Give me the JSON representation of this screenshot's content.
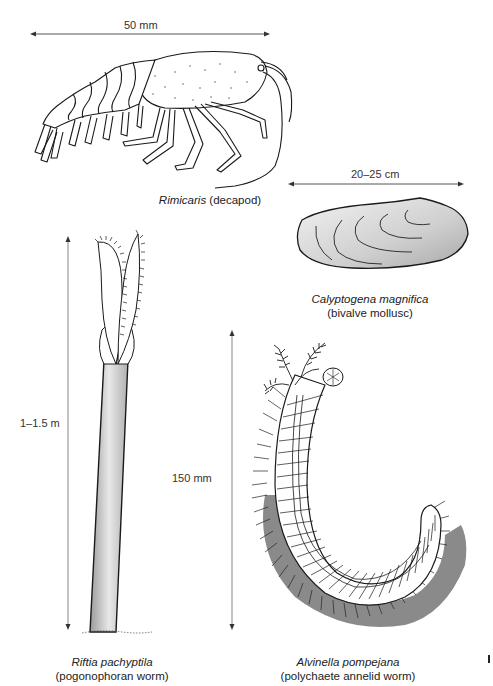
{
  "figure": {
    "specimens": [
      {
        "id": "rimicaris",
        "scientific_name": "Rimicaris",
        "common_name": "(decapod)",
        "scale_label": "50 mm",
        "scale_orientation": "horizontal"
      },
      {
        "id": "calyptogena",
        "scientific_name": "Calyptogena magnifica",
        "common_name": "(bivalve mollusc)",
        "scale_label": "20–25 cm",
        "scale_orientation": "horizontal"
      },
      {
        "id": "riftia",
        "scientific_name": "Riftia pachyptila",
        "common_name": "(pogonophoran worm)",
        "scale_label": "1–1.5 m",
        "scale_orientation": "vertical"
      },
      {
        "id": "alvinella",
        "scientific_name": "Alvinella pompejana",
        "common_name": "(polychaete annelid worm)",
        "scale_label": "150 mm",
        "scale_orientation": "vertical"
      }
    ],
    "colors": {
      "line": "#1a1a1a",
      "scale_line": "#555555",
      "shell_fill": "#d4d4d4",
      "tube_fill": "#c8c8c8",
      "worm_shadow": "#8a8a8a"
    }
  }
}
